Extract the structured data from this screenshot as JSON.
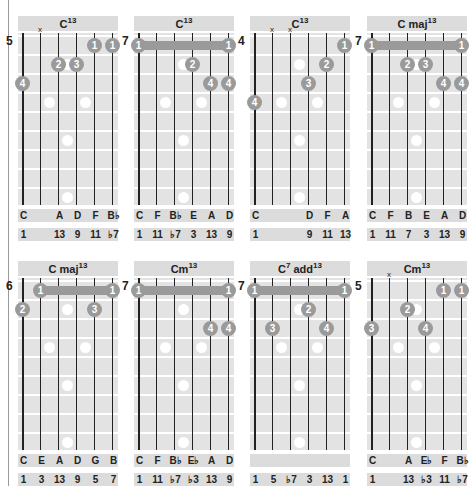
{
  "chords": [
    {
      "id": "c13-pos5",
      "name": "C",
      "sup": "13",
      "start_fret": "5",
      "muted_strings": [
        1
      ],
      "barre": null,
      "fingers": [
        {
          "string": 0,
          "fret": 3,
          "label": "4"
        },
        {
          "string": 2,
          "fret": 2,
          "label": "2"
        },
        {
          "string": 3,
          "fret": 2,
          "label": "3"
        },
        {
          "string": 4,
          "fret": 1,
          "label": "1"
        },
        {
          "string": 5,
          "fret": 1,
          "label": "1"
        }
      ],
      "notes": [
        "C",
        "",
        "A",
        "D",
        "F",
        "B♭"
      ],
      "intervals": [
        "1",
        "",
        "13",
        "9",
        "11",
        "♭7"
      ]
    },
    {
      "id": "c13-pos7",
      "name": "C",
      "sup": "13",
      "start_fret": "7",
      "muted_strings": [],
      "barre": {
        "fret": 1,
        "from": 0,
        "to": 5,
        "label": "1"
      },
      "fingers": [
        {
          "string": 3,
          "fret": 2,
          "label": "2"
        },
        {
          "string": 4,
          "fret": 3,
          "label": "4"
        },
        {
          "string": 5,
          "fret": 3,
          "label": "4"
        }
      ],
      "notes": [
        "C",
        "F",
        "B♭",
        "E",
        "A",
        "D"
      ],
      "intervals": [
        "1",
        "11",
        "♭7",
        "3",
        "13",
        "9"
      ]
    },
    {
      "id": "c13-pos4",
      "name": "C",
      "sup": "13",
      "start_fret": "4",
      "muted_strings": [
        1,
        2
      ],
      "barre": null,
      "fingers": [
        {
          "string": 0,
          "fret": 4,
          "label": "4"
        },
        {
          "string": 3,
          "fret": 3,
          "label": "3"
        },
        {
          "string": 4,
          "fret": 2,
          "label": "2"
        },
        {
          "string": 5,
          "fret": 1,
          "label": "1"
        }
      ],
      "notes": [
        "C",
        "",
        "",
        "D",
        "F",
        "A"
      ],
      "intervals": [
        "1",
        "",
        "",
        "9",
        "11",
        "13"
      ]
    },
    {
      "id": "cmaj13-pos7",
      "name": "C maj",
      "sup": "13",
      "start_fret": "7",
      "muted_strings": [],
      "barre": {
        "fret": 1,
        "from": 0,
        "to": 5,
        "label": "1"
      },
      "fingers": [
        {
          "string": 2,
          "fret": 2,
          "label": "2"
        },
        {
          "string": 3,
          "fret": 2,
          "label": "3"
        },
        {
          "string": 4,
          "fret": 3,
          "label": "4"
        },
        {
          "string": 5,
          "fret": 3,
          "label": "4"
        }
      ],
      "notes": [
        "C",
        "F",
        "B",
        "E",
        "A",
        "D"
      ],
      "intervals": [
        "1",
        "11",
        "7",
        "3",
        "13",
        "9"
      ]
    },
    {
      "id": "cmaj13-pos6",
      "name": "C maj",
      "sup": "13",
      "start_fret": "6",
      "muted_strings": [],
      "barre": {
        "fret": 1,
        "from": 1,
        "to": 5,
        "label": "1"
      },
      "fingers": [
        {
          "string": 0,
          "fret": 2,
          "label": "2"
        },
        {
          "string": 4,
          "fret": 2,
          "label": "3"
        }
      ],
      "notes": [
        "C",
        "E",
        "A",
        "D",
        "G",
        "B"
      ],
      "intervals": [
        "1",
        "3",
        "13",
        "9",
        "5",
        "7"
      ]
    },
    {
      "id": "cm13-pos7",
      "name": "Cm",
      "sup": "13",
      "start_fret": "7",
      "muted_strings": [],
      "barre": {
        "fret": 1,
        "from": 0,
        "to": 5,
        "label": "1"
      },
      "fingers": [
        {
          "string": 4,
          "fret": 3,
          "label": "4"
        },
        {
          "string": 5,
          "fret": 3,
          "label": "4"
        }
      ],
      "notes": [
        "C",
        "F",
        "B♭",
        "E♭",
        "A",
        "D"
      ],
      "intervals": [
        "1",
        "11",
        "♭7",
        "♭3",
        "13",
        "9"
      ]
    },
    {
      "id": "c7add13-pos7",
      "name": "C",
      "sup7": "7",
      "mid": " add",
      "sup": "13",
      "start_fret": "7",
      "muted_strings": [],
      "barre": {
        "fret": 1,
        "from": 0,
        "to": 5,
        "label": "1"
      },
      "fingers": [
        {
          "string": 1,
          "fret": 3,
          "label": "3"
        },
        {
          "string": 3,
          "fret": 2,
          "label": "2"
        },
        {
          "string": 4,
          "fret": 3,
          "label": "4"
        }
      ],
      "notes": [
        "",
        "",
        "",
        "",
        "",
        ""
      ],
      "intervals": [
        "1",
        "5",
        "♭7",
        "3",
        "13",
        "1"
      ]
    },
    {
      "id": "cm13-pos5",
      "name": "Cm",
      "sup": "13",
      "start_fret": "5",
      "muted_strings": [
        1
      ],
      "barre": null,
      "fingers": [
        {
          "string": 0,
          "fret": 3,
          "label": "3"
        },
        {
          "string": 2,
          "fret": 2,
          "label": "2"
        },
        {
          "string": 3,
          "fret": 3,
          "label": "4"
        },
        {
          "string": 4,
          "fret": 1,
          "label": "1"
        },
        {
          "string": 5,
          "fret": 1,
          "label": "1"
        }
      ],
      "notes": [
        "C",
        "",
        "A",
        "E♭",
        "F",
        "B♭"
      ],
      "intervals": [
        "1",
        "",
        "13",
        "♭3",
        "11",
        "♭7"
      ]
    }
  ],
  "colors": {
    "finger": "#9a9a9a",
    "board": "#e3e3e3",
    "header": "#dcdcdc"
  }
}
